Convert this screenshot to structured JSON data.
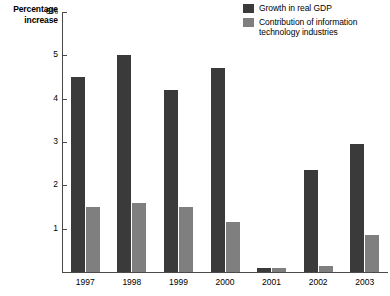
{
  "chart_data": {
    "type": "bar",
    "title": "",
    "ylabel": "Percentage increase",
    "xlabel": "",
    "ylim": [
      0,
      6
    ],
    "yticks": [
      1,
      2,
      3,
      4,
      5,
      6
    ],
    "ytick_labels": [
      "1",
      "2",
      "3",
      "4",
      "5",
      "6%"
    ],
    "grid": false,
    "legend_position": "top-right",
    "categories": [
      "1997",
      "1998",
      "1999",
      "2000",
      "2001",
      "2002",
      "2003"
    ],
    "series": [
      {
        "name": "Growth in real GDP",
        "color": "#3a3a3a",
        "values": [
          4.5,
          5.0,
          4.2,
          4.7,
          0.1,
          2.35,
          2.95
        ]
      },
      {
        "name": "Contribution of information technology industries",
        "color": "#7f7f7f",
        "values": [
          1.5,
          1.6,
          1.5,
          1.15,
          0.1,
          0.15,
          0.85
        ]
      }
    ]
  },
  "axis_title": {
    "line1": "Percentage",
    "line2": "increase"
  },
  "legend": {
    "items": [
      {
        "label": "Growth in real GDP",
        "color": "#3a3a3a"
      },
      {
        "label": "Contribution of information technology industries",
        "color": "#7f7f7f"
      }
    ]
  }
}
